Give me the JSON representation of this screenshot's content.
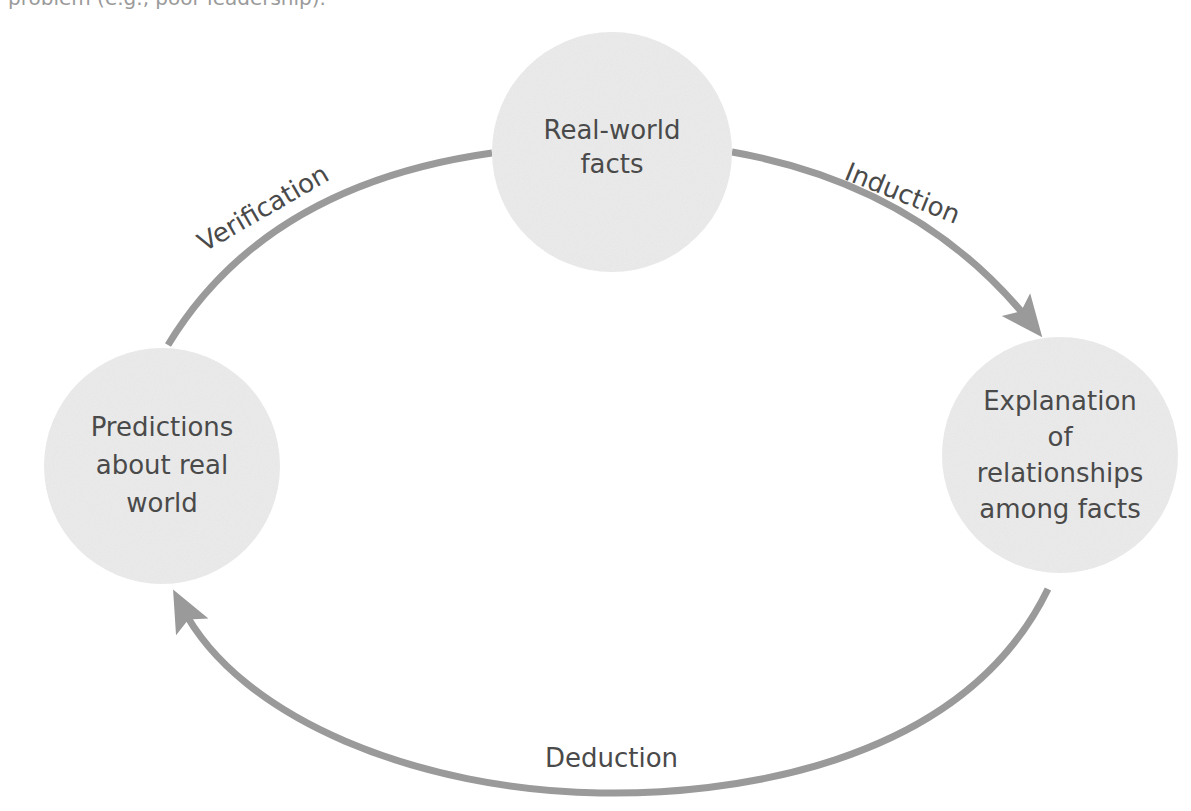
{
  "header": {
    "clipped_text": "problem (e.g., poor leadership)."
  },
  "diagram": {
    "title": "",
    "colors": {
      "node_fill": "#ebebeb",
      "edge": "#9a9a9a",
      "text": "#4a4a4a",
      "background": "#ffffff"
    },
    "nodes": [
      {
        "id": "real_world_facts",
        "lines": [
          "Real-world",
          "facts"
        ]
      },
      {
        "id": "explanation",
        "lines": [
          "Explanation",
          "of",
          "relationships",
          "among facts"
        ]
      },
      {
        "id": "predictions",
        "lines": [
          "Predictions",
          "about real",
          "world"
        ]
      }
    ],
    "edges": [
      {
        "from": "real_world_facts",
        "to": "explanation",
        "label": "Induction"
      },
      {
        "from": "explanation",
        "to": "predictions",
        "label": "Deduction"
      },
      {
        "from": "predictions",
        "to": "real_world_facts",
        "label": "Verification"
      }
    ]
  }
}
